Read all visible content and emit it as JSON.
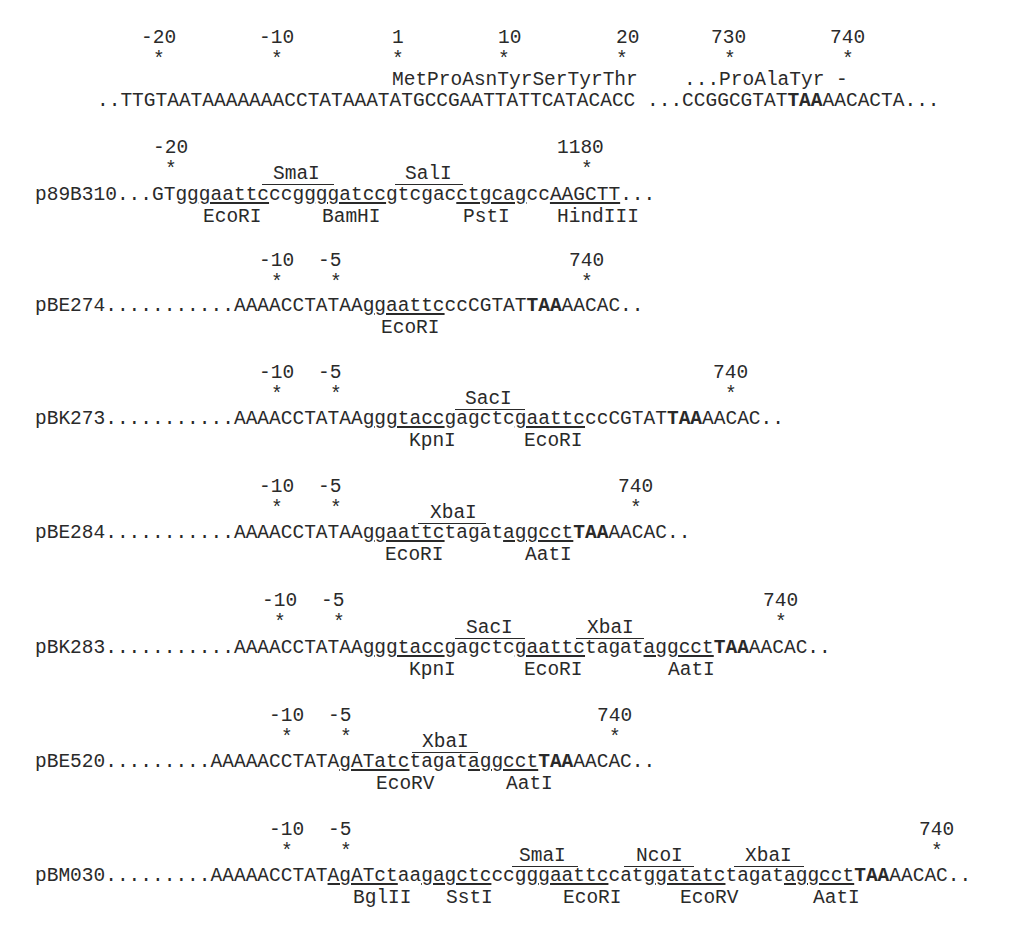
{
  "figure": {
    "reference": {
      "position_numbers": [
        "-20",
        "-10",
        "1",
        "10",
        "20",
        "730",
        "740"
      ],
      "amino_acids_start": "MetProAsnTyrSerTyrThr",
      "amino_acids_end": "...ProAlaTyr -",
      "sequence_part1": "..TTGTAATAAAAAAACCTATAAATATGCCGAATTATTCATACACC",
      "sequence_part2_pre": " ...CCGGCGTAT",
      "stop_codon": "TAA",
      "sequence_part2_post": "AACACTA..."
    },
    "constructs": [
      {
        "name": "p89B310",
        "positions": [
          "-20",
          "1180"
        ],
        "segments": [
          {
            "t": "p89B310...GTgg",
            "s": ""
          },
          {
            "t": "gaattc",
            "s": "u"
          },
          {
            "t": "ccgg",
            "s": ""
          },
          {
            "t": "ggatcc",
            "s": "u"
          },
          {
            "t": "gtcgac",
            "s": ""
          },
          {
            "t": "ctgcag",
            "s": "u"
          },
          {
            "t": "cc",
            "s": ""
          },
          {
            "t": "AAGCTT",
            "s": "u"
          },
          {
            "t": "...",
            "s": ""
          }
        ],
        "sites_above": [
          "SmaI",
          "SalI"
        ],
        "sites_below": [
          "EcoRI",
          "BamHI",
          "PstI",
          "HindIII"
        ]
      },
      {
        "name": "pBE274",
        "positions": [
          "-10",
          "-5",
          "740"
        ],
        "segments": [
          {
            "t": "pBE274...........AAAACCTATAAg",
            "s": ""
          },
          {
            "t": "gaattc",
            "s": "u"
          },
          {
            "t": "ccCGTAT",
            "s": ""
          },
          {
            "t": "TAA",
            "s": "b"
          },
          {
            "t": "AACAC..",
            "s": ""
          }
        ],
        "sites_above": [],
        "sites_below": [
          "EcoRI"
        ]
      },
      {
        "name": "pBK273",
        "positions": [
          "-10",
          "-5",
          "740"
        ],
        "segments": [
          {
            "t": "pBK273...........AAAACCTATAAg",
            "s": ""
          },
          {
            "t": "ggtacc",
            "s": "u"
          },
          {
            "t": "gagctc",
            "s": ""
          },
          {
            "t": "gaattc",
            "s": "u"
          },
          {
            "t": "ccCGTAT",
            "s": ""
          },
          {
            "t": "TAA",
            "s": "b"
          },
          {
            "t": "AACAC..",
            "s": ""
          }
        ],
        "sites_above": [
          "SacI"
        ],
        "sites_below": [
          "KpnI",
          "EcoRI"
        ]
      },
      {
        "name": "pBE284",
        "positions": [
          "-10",
          "-5",
          "740"
        ],
        "segments": [
          {
            "t": "pBE284...........AAAACCTATAAg",
            "s": ""
          },
          {
            "t": "gaattc",
            "s": "u"
          },
          {
            "t": "tagat",
            "s": ""
          },
          {
            "t": "aggcct",
            "s": "u"
          },
          {
            "t": "TAA",
            "s": "b"
          },
          {
            "t": "AACAC..",
            "s": ""
          }
        ],
        "sites_above": [
          "XbaI"
        ],
        "sites_below": [
          "EcoRI",
          "AatI"
        ]
      },
      {
        "name": "pBK283",
        "positions": [
          "-10",
          "-5",
          "740"
        ],
        "segments": [
          {
            "t": "pBK283...........AAAACCTATAAg",
            "s": ""
          },
          {
            "t": "ggtacc",
            "s": "u"
          },
          {
            "t": "gagctc",
            "s": ""
          },
          {
            "t": "gaattc",
            "s": "u"
          },
          {
            "t": "tagat",
            "s": ""
          },
          {
            "t": "aggcct",
            "s": "u"
          },
          {
            "t": "TAA",
            "s": "b"
          },
          {
            "t": "AACAC..",
            "s": ""
          }
        ],
        "sites_above": [
          "SacI",
          "XbaI"
        ],
        "sites_below": [
          "KpnI",
          "EcoRI",
          "AatI"
        ]
      },
      {
        "name": "pBE520",
        "positions": [
          "-10",
          "-5",
          "740"
        ],
        "segments": [
          {
            "t": "pBE520.........AAAAACCTATA",
            "s": ""
          },
          {
            "t": "gATatc",
            "s": "u"
          },
          {
            "t": "tagat",
            "s": ""
          },
          {
            "t": "aggcct",
            "s": "u"
          },
          {
            "t": "TAA",
            "s": "b"
          },
          {
            "t": "AACAC..",
            "s": ""
          }
        ],
        "sites_above": [
          "XbaI"
        ],
        "sites_below": [
          "EcoRV",
          "AatI"
        ]
      },
      {
        "name": "pBM030",
        "positions": [
          "-10",
          "-5",
          "740"
        ],
        "segments": [
          {
            "t": "pBM030.........AAAAACCTAT",
            "s": ""
          },
          {
            "t": "AgATct",
            "s": "u"
          },
          {
            "t": "aa",
            "s": ""
          },
          {
            "t": "gagctc",
            "s": "u"
          },
          {
            "t": "ccgg",
            "s": ""
          },
          {
            "t": "gaattc",
            "s": "u"
          },
          {
            "t": "catg",
            "s": ""
          },
          {
            "t": "gatatc",
            "s": "u"
          },
          {
            "t": "tagat",
            "s": ""
          },
          {
            "t": "aggcct",
            "s": "u"
          },
          {
            "t": "TAA",
            "s": "b"
          },
          {
            "t": "AACAC..",
            "s": ""
          }
        ],
        "sites_above": [
          "SmaI",
          "NcoI",
          "XbaI"
        ],
        "sites_below": [
          "BglII",
          "SstI",
          "EcoRI",
          "EcoRV",
          "AatI"
        ]
      }
    ],
    "marker": "*"
  }
}
